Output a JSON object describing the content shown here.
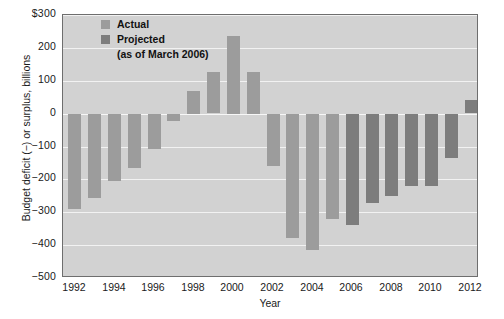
{
  "chart_data": {
    "type": "bar",
    "title": "",
    "xlabel": "Year",
    "ylabel": "Budget deficit (−) or surplus, billions",
    "ylim": [
      -500,
      300
    ],
    "ytick_values": [
      300,
      200,
      100,
      0,
      -100,
      -200,
      -300,
      -400,
      -500
    ],
    "ytick_labels": [
      "$300",
      "200",
      "100",
      "0",
      "−100",
      "−200",
      "−300",
      "−400",
      "−500"
    ],
    "xtick_labels": [
      "1992",
      "1994",
      "1996",
      "1998",
      "2000",
      "2002",
      "2004",
      "2006",
      "2008",
      "2010",
      "2012"
    ],
    "grid": true,
    "legend_position": "top-left",
    "categories": [
      1992,
      1993,
      1994,
      1995,
      1996,
      1997,
      1998,
      1999,
      2000,
      2001,
      2002,
      2003,
      2004,
      2005,
      2006,
      2007,
      2008,
      2009,
      2010,
      2011,
      2012
    ],
    "values": [
      -290,
      -255,
      -203,
      -164,
      -107,
      -22,
      69,
      126,
      236,
      128,
      -158,
      -378,
      -413,
      -318,
      -337,
      -270,
      -250,
      -220,
      -220,
      -135,
      40
    ],
    "series": [
      {
        "name": "Actual",
        "color": "#9c9c9c",
        "points": [
          {
            "year": 1992,
            "value": -290
          },
          {
            "year": 1993,
            "value": -255
          },
          {
            "year": 1994,
            "value": -203
          },
          {
            "year": 1995,
            "value": -164
          },
          {
            "year": 1996,
            "value": -107
          },
          {
            "year": 1997,
            "value": -22
          },
          {
            "year": 1998,
            "value": 69
          },
          {
            "year": 1999,
            "value": 126
          },
          {
            "year": 2000,
            "value": 236
          },
          {
            "year": 2001,
            "value": 128
          },
          {
            "year": 2002,
            "value": -158
          },
          {
            "year": 2003,
            "value": -378
          },
          {
            "year": 2004,
            "value": -413
          },
          {
            "year": 2005,
            "value": -318
          }
        ]
      },
      {
        "name": "Projected",
        "color": "#7d7d7d",
        "points": [
          {
            "year": 2006,
            "value": -337
          },
          {
            "year": 2007,
            "value": -270
          },
          {
            "year": 2008,
            "value": -250
          },
          {
            "year": 2009,
            "value": -220
          },
          {
            "year": 2010,
            "value": -220
          },
          {
            "year": 2011,
            "value": -135
          },
          {
            "year": 2012,
            "value": 40
          }
        ]
      }
    ]
  },
  "legend": {
    "actual_label": "Actual",
    "projected_label": "Projected",
    "projected_sublabel": "(as of March 2006)"
  },
  "axes": {
    "y_title": "Budget deficit (−) or surplus, billions",
    "x_title": "Year"
  }
}
